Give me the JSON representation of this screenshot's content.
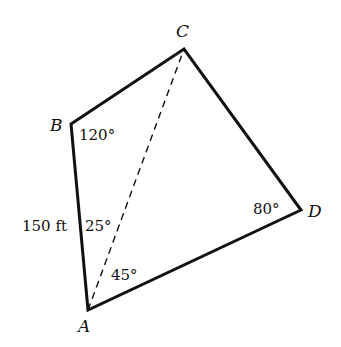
{
  "diagram": {
    "type": "quadrilateral",
    "vertices": {
      "A": {
        "label": "A"
      },
      "B": {
        "label": "B"
      },
      "C": {
        "label": "C"
      },
      "D": {
        "label": "D"
      }
    },
    "edges": [
      "AB",
      "BC",
      "CD",
      "DA"
    ],
    "diagonal": {
      "from": "A",
      "to": "C",
      "style": "dashed"
    },
    "angle_labels": {
      "B": "120°",
      "D": "80°",
      "A_upper": "25°",
      "A_lower": "45°"
    },
    "side_labels": {
      "AB": "150 ft"
    },
    "colors": {
      "line": "#111111",
      "background": "#ffffff"
    }
  }
}
